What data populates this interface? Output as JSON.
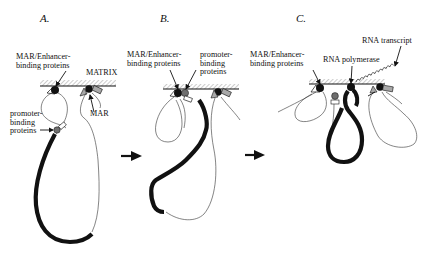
{
  "panels": {
    "a": {
      "letter": "A."
    },
    "b": {
      "letter": "B."
    },
    "c": {
      "letter": "C."
    }
  },
  "labels": {
    "a_mar_enh_1": "MAR/Enhancer-",
    "a_mar_enh_2": "binding proteins",
    "a_matrix": "MATRIX",
    "a_prom_1": "promoter-",
    "a_prom_2": "binding",
    "a_prom_3": "proteins",
    "a_mar": "MAR",
    "b_mar_enh_1": "MAR/Enhancer-",
    "b_mar_enh_2": "binding proteins",
    "b_prom_1": "promoter-",
    "b_prom_2": "binding",
    "b_prom_3": "proteins",
    "c_mar_enh_1": "MAR/Enhancer-",
    "c_mar_enh_2": "binding proteins",
    "c_polymerase": "RNA polymerase",
    "c_transcript": "RNA transcript"
  },
  "colors": {
    "ink": "#111111",
    "hatch": "#9a9a9a",
    "promoter_protein": "#6e6e6e",
    "mar_protein": "#a8a8a8"
  }
}
